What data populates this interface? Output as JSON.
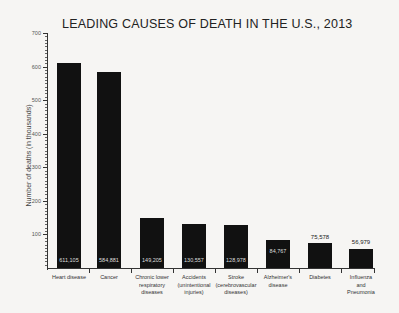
{
  "chart_data": {
    "type": "bar",
    "title": "LEADING CAUSES OF DEATH IN THE U.S., 2013",
    "xlabel": "",
    "ylabel": "Number of deaths (in thousands)",
    "ylim": [
      0,
      700
    ],
    "yticks": [
      "100",
      "200",
      "300",
      "400",
      "500",
      "600",
      "700"
    ],
    "grid": false,
    "categories": [
      "Heart disease",
      "Cancer",
      "Chronic lower respiratory diseases",
      "Accidents (unintentional injuries)",
      "Stroke (cerebrovascular diseases)",
      "Alzheimer's disease",
      "Diabetes",
      "Influenza and Pneumonia"
    ],
    "values": [
      611105,
      584881,
      149205,
      130557,
      128978,
      84767,
      75578,
      56979
    ],
    "value_labels": [
      "611,105",
      "584,881",
      "149,205",
      "130,557",
      "128,978",
      "84,767",
      "75,578",
      "56,979"
    ],
    "bar_color": "#111111"
  },
  "labels": {
    "cat0": "Heart disease",
    "cat1": "Cancer",
    "cat2a": "Chronic lower",
    "cat2b": "respiratory",
    "cat2c": "diseases",
    "cat3a": "Accidents",
    "cat3b": "(unintentional",
    "cat3c": "injuries)",
    "cat4a": "Stroke",
    "cat4b": "(cerebrovascular",
    "cat4c": "diseases)",
    "cat5a": "Alzheimer's",
    "cat5b": "disease",
    "cat6": "Diabetes",
    "cat7a": "Influenza",
    "cat7b": "and",
    "cat7c": "Pneumonia"
  }
}
